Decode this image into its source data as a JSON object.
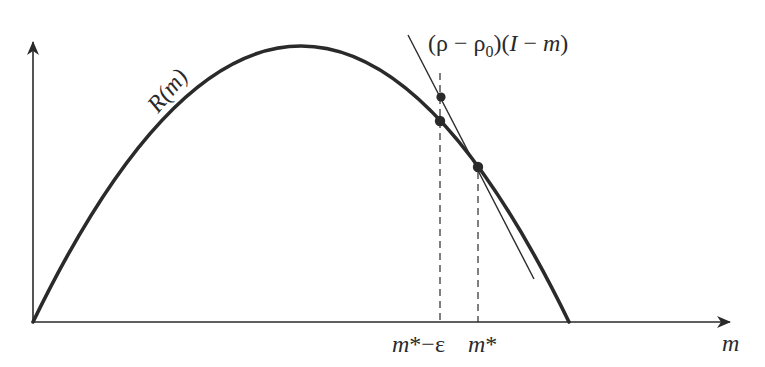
{
  "diagram": {
    "type": "function-plot",
    "colors": {
      "background": "#ffffff",
      "ink": "#2a2a2a"
    },
    "curve": {
      "label": "R(m)",
      "shape": "inverted parabola",
      "start": [
        33,
        322
      ],
      "peak": [
        301,
        46
      ],
      "end": [
        569,
        322
      ]
    },
    "line": {
      "label": "(ρ − ρ₀)(I − m)",
      "from": [
        408,
        35
      ],
      "to": [
        534,
        279
      ]
    },
    "axes": {
      "origin": [
        33,
        322
      ],
      "x_axis_end": [
        730,
        322
      ],
      "y_axis_end": [
        33,
        40
      ],
      "x_label": "m",
      "y_label": ""
    },
    "markers": [
      {
        "name": "line-point-at-m-star-minus-epsilon",
        "x": 441,
        "y": 97
      },
      {
        "name": "curve-point-at-m-star-minus-epsilon",
        "x": 440,
        "y": 121
      },
      {
        "name": "intersection-at-m-star",
        "x": 478,
        "y": 167
      }
    ],
    "guides": [
      {
        "name": "dashed-m-star-minus-epsilon",
        "x": 440,
        "y_top": 73,
        "y_bottom": 322
      },
      {
        "name": "dashed-m-star",
        "x": 478,
        "y_top": 167,
        "y_bottom": 322
      }
    ],
    "tick_labels": [
      {
        "text": "m*−ε",
        "x": 427
      },
      {
        "text": "m*",
        "x": 496
      }
    ]
  },
  "labels": {
    "curve": "R(m)",
    "line_part1": "(ρ − ρ",
    "line_sub": "0",
    "line_part2": ")(",
    "line_I": "I",
    "line_minus": " − ",
    "line_m": "m",
    "line_close": ")",
    "x_axis": "m",
    "tick_m_star_eps_m": "m",
    "tick_m_star_eps_rest": "*−ε",
    "tick_m_star_m": "m",
    "tick_m_star_rest": "*"
  }
}
